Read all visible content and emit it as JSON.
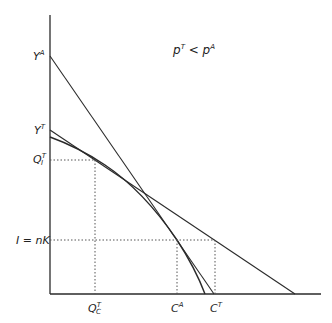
{
  "diagram": {
    "title_annotation": {
      "base1": "p",
      "sup1": "T",
      "op": " < ",
      "base2": "p",
      "sup2": "A"
    },
    "axes": {
      "y_labels": {
        "YA": {
          "base": "Y",
          "sup": "A"
        },
        "YT": {
          "base": "Y",
          "sup": "T"
        },
        "QI": {
          "base": "Q",
          "sup": "T",
          "sub": "I"
        },
        "InK": {
          "text": "I = nK"
        }
      },
      "x_labels": {
        "QC": {
          "base": "Q",
          "sup": "T",
          "sub": "C"
        },
        "CA": {
          "base": "C",
          "sup": "A"
        },
        "CT": {
          "base": "C",
          "sup": "T"
        }
      }
    },
    "colors": {
      "line": "#2a2a2a",
      "dotted": "#555555",
      "background": "#ffffff"
    }
  }
}
